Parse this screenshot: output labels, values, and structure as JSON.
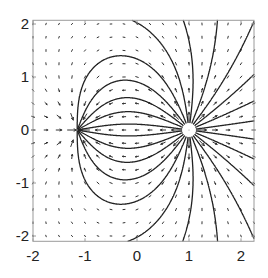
{
  "chart_data": {
    "type": "quiver",
    "title": "",
    "xlabel": "",
    "ylabel": "",
    "xlim": [
      -2,
      2.25
    ],
    "ylim": [
      -2.1,
      2.07
    ],
    "grid": false,
    "legend": null,
    "x_ticks": [
      -2,
      -1,
      0,
      1,
      2
    ],
    "x_tick_labels": [
      "-2",
      "-1",
      "0",
      "1",
      "2"
    ],
    "y_ticks": [
      -2,
      -1,
      0,
      1,
      2
    ],
    "y_tick_labels": [
      "-2",
      "-1",
      "0",
      "1",
      "2"
    ],
    "quiver_grid": {
      "x_start": -2,
      "x_end": 2.25,
      "y_start": -2,
      "y_end": 2,
      "step": 0.25
    },
    "charges": [
      {
        "role": "source",
        "x": 1.0,
        "y": 0.0,
        "strength": 1.0
      },
      {
        "role": "sink",
        "x": -1.15,
        "y": 0.0,
        "strength": 0.62
      }
    ],
    "streamlines": {
      "count": 24,
      "seed": "source",
      "seed_radius": 0.13
    },
    "source_marker": {
      "x": 1.0,
      "y": 0.0,
      "radius": 0.13,
      "fill": "#ffffff"
    },
    "colors": {
      "lines": "#222222",
      "arrows": "#333333",
      "axes": "#9a9a9a",
      "text": "#222222"
    }
  }
}
